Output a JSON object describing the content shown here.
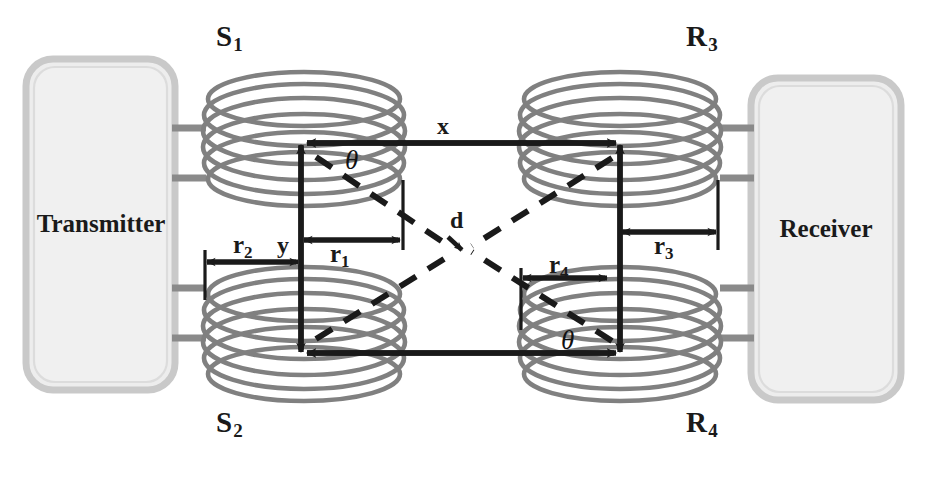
{
  "figure": {
    "type": "schematic-diagram"
  },
  "blocks": {
    "transmitter": {
      "label": "Transmitter"
    },
    "receiver": {
      "label": "Receiver"
    }
  },
  "coils": [
    {
      "id": "s1",
      "label": "S",
      "sub": "1",
      "role": "source-coil-top-left"
    },
    {
      "id": "s2",
      "label": "S",
      "sub": "2",
      "role": "source-coil-bottom-left"
    },
    {
      "id": "r3",
      "label": "R",
      "sub": "3",
      "role": "receiver-coil-top-right"
    },
    {
      "id": "r4",
      "label": "R",
      "sub": "4",
      "role": "receiver-coil-bottom-right"
    }
  ],
  "dimensions": [
    {
      "id": "x",
      "label": "x",
      "sub": "",
      "meaning": "horizontal separation between transmitter and receiver coil axes"
    },
    {
      "id": "y",
      "label": "y",
      "sub": "",
      "meaning": "vertical separation between upper and lower coil axes"
    },
    {
      "id": "d",
      "label": "d",
      "sub": "",
      "meaning": "diagonal cross-coupling distance"
    },
    {
      "id": "r1",
      "label": "r",
      "sub": "1",
      "meaning": "radius of coil S1"
    },
    {
      "id": "r2",
      "label": "r",
      "sub": "2",
      "meaning": "radius of coil S2"
    },
    {
      "id": "r3",
      "label": "r",
      "sub": "3",
      "meaning": "radius of coil R3"
    },
    {
      "id": "r4",
      "label": "r",
      "sub": "4",
      "meaning": "radius of coil R4"
    }
  ],
  "angles": [
    {
      "id": "theta-top",
      "label": "θ",
      "meaning": "angle between x-axis and diagonal d at coil S1"
    },
    {
      "id": "theta-bottom",
      "label": "θ",
      "meaning": "angle between x-axis and diagonal d at coil R4"
    }
  ],
  "colors": {
    "coil_wire": "#808080",
    "block_fill": "#ededed",
    "block_border": "#c4c4c4",
    "annotation": "#1a1a1a",
    "background": "#ffffff"
  }
}
